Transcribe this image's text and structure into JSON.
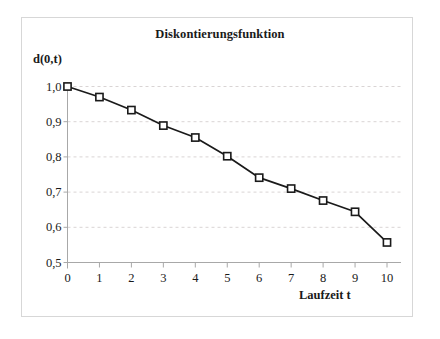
{
  "chart_data": {
    "type": "line",
    "title": "Diskontierungsfunktion",
    "xlabel": "Laufzeit t",
    "ylabel": "d(0,t)",
    "x": [
      0,
      1,
      2,
      3,
      4,
      5,
      6,
      7,
      8,
      9,
      10
    ],
    "values": [
      1.0,
      0.97,
      0.933,
      0.889,
      0.855,
      0.802,
      0.741,
      0.71,
      0.676,
      0.644,
      0.557
    ],
    "xtick_labels": [
      "0",
      "1",
      "2",
      "3",
      "4",
      "5",
      "6",
      "7",
      "8",
      "9",
      "10"
    ],
    "ytick_values": [
      0.5,
      0.6,
      0.7,
      0.8,
      0.9,
      1.0
    ],
    "ytick_labels": [
      "0,5",
      "0,6",
      "0,7",
      "0,8",
      "0,9",
      "1,0"
    ],
    "xlim": [
      0,
      10
    ],
    "ylim": [
      0.5,
      1.0
    ],
    "grid": true,
    "grid_axis": "y",
    "grid_style": "dashed",
    "legend": false,
    "marker": "open-square",
    "line_color": "#1a1a1a",
    "marker_face_color": "#ffffff",
    "marker_edge_color": "#1a1a1a",
    "grid_color": "#d9d4d4",
    "axis_color": "#a8a8a8",
    "background_color": "#ffffff"
  }
}
